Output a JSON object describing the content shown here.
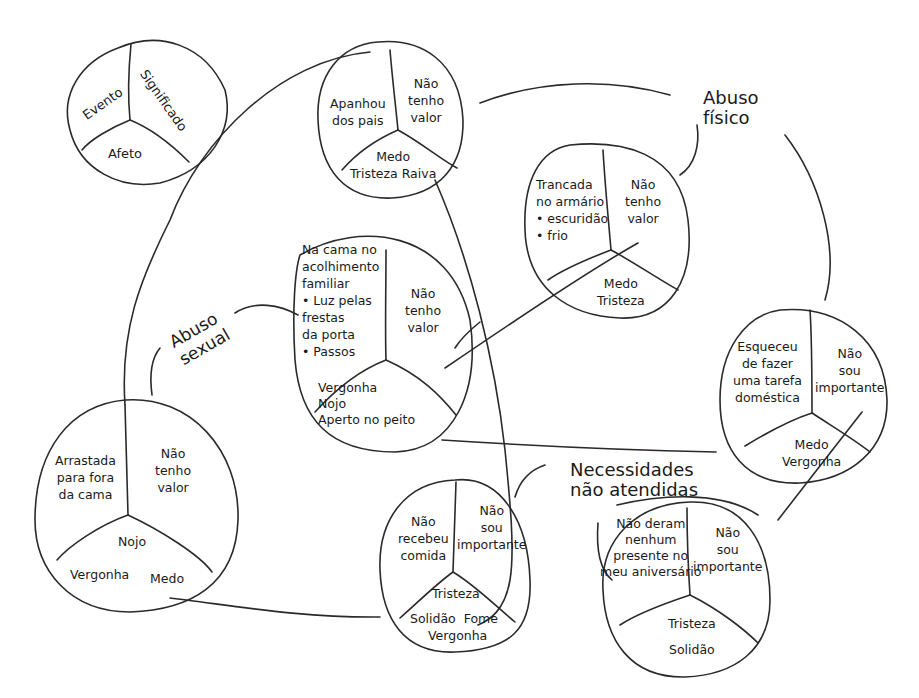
{
  "diagram": {
    "type": "event-meaning-affect map",
    "legend": {
      "event": "Evento",
      "meaning": "Significado",
      "affect": "Afeto"
    },
    "categories": {
      "physical_abuse": "Abuso\nfísico",
      "sexual_abuse": "Abuso\nsexual",
      "unmet_needs": "Necessidades\nnão atendidas"
    },
    "nodes": [
      {
        "id": "apanhou",
        "event": "Apanhou\ndos pais",
        "meaning": "Não\ntenho\nvalor",
        "affect": "Medo\nTristeza Raiva"
      },
      {
        "id": "trancada",
        "event": "Trancada\nno armário\n• escuridão\n• frio",
        "meaning": "Não\ntenho\nvalor",
        "affect": "Medo\nTristeza"
      },
      {
        "id": "cama",
        "event": "Na cama no\nacolhimento\nfamiliar\n• Luz pelas\nfrestas\nda porta\n• Passos",
        "meaning": "Não\ntenho\nvalor",
        "affect": "Vergonha\nNojo\nAperto no peito"
      },
      {
        "id": "esqueceu",
        "event": "Esqueceu\nde fazer\numa tarefa\ndoméstica",
        "meaning": "Não\nsou\nimportante",
        "affect": "Medo\nVergonha"
      },
      {
        "id": "arrastada",
        "event": "Arrastada\npara fora\nda cama",
        "meaning": "Não\ntenho\nvalor",
        "affect_top": "Nojo",
        "affect_left": "Vergonha",
        "affect_right": "Medo"
      },
      {
        "id": "comida",
        "event": "Não\nrecebeu\ncomida",
        "meaning": "Não\nsou\nimportante",
        "affect_top": "Tristeza",
        "affect_mid": "Solidão  Fome",
        "affect_bottom": "Vergonha"
      },
      {
        "id": "presente",
        "event": "Não deram\nnenhum\npresente no\nmeu aniversário",
        "meaning": "Não\nsou\nimportante",
        "affect": "Tristeza\n\nSolidão"
      }
    ]
  }
}
